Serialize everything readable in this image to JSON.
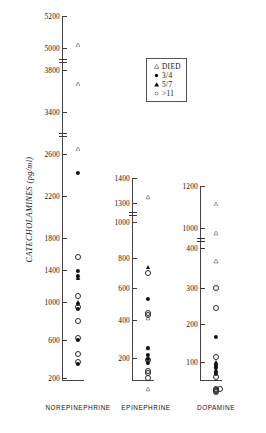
{
  "chart_data": {
    "type": "scatter",
    "title": "",
    "ylabel": "CATECHOLAMINES  (pg/ml)",
    "xlabel": "",
    "grid": false,
    "legend_position": "top-center",
    "note": "Three independent vertical dot-plot panels, each with its own broken y-axis scale. Marker shape/fill encodes outcome group.",
    "legend": [
      {
        "symbol": "open-triangle",
        "label": "DIED"
      },
      {
        "symbol": "filled-circle",
        "label": "3/4"
      },
      {
        "symbol": "filled-triangle",
        "label": "5/7"
      },
      {
        "symbol": "open-circle",
        "label": ">11"
      }
    ],
    "categories": [
      "NOREPINEPHRINE",
      "EPINEPHRINE",
      "DOPAMINE"
    ],
    "panels": [
      {
        "name": "NOREPINEPHRINE",
        "tick_labels": [
          "5200",
          "5000",
          "3800",
          "3400",
          "2600",
          "2200",
          "1800",
          "1400",
          "1000",
          "600",
          "200"
        ],
        "axis_breaks": [
          "between 5000 and 3800",
          "between 3400 and 2600"
        ],
        "points": [
          {
            "value": 5080,
            "symbol": "open-triangle"
          },
          {
            "value": 3760,
            "symbol": "open-triangle"
          },
          {
            "value": 2880,
            "symbol": "open-triangle"
          },
          {
            "value": 2420,
            "symbol": "filled-circle"
          },
          {
            "value": 1560,
            "symbol": "open-circle"
          },
          {
            "value": 1430,
            "symbol": "open-triangle"
          },
          {
            "value": 1390,
            "symbol": "filled-circle"
          },
          {
            "value": 1330,
            "symbol": "filled-circle"
          },
          {
            "value": 1300,
            "symbol": "filled-triangle"
          },
          {
            "value": 1080,
            "symbol": "open-circle"
          },
          {
            "value": 1000,
            "symbol": "filled-triangle"
          },
          {
            "value": 980,
            "symbol": "filled-circle"
          },
          {
            "value": 950,
            "symbol": "open-circle"
          },
          {
            "value": 930,
            "symbol": "filled-circle"
          },
          {
            "value": 800,
            "symbol": "open-circle"
          },
          {
            "value": 620,
            "symbol": "open-circle"
          },
          {
            "value": 600,
            "symbol": "filled-circle"
          },
          {
            "value": 450,
            "symbol": "open-circle"
          },
          {
            "value": 370,
            "symbol": "open-circle"
          },
          {
            "value": 345,
            "symbol": "filled-circle"
          }
        ]
      },
      {
        "name": "EPINEPHRINE",
        "tick_labels": [
          "1400",
          "1300",
          "1000",
          "800",
          "600",
          "400",
          "200"
        ],
        "axis_breaks": [
          "between 1300 and 1000"
        ],
        "points": [
          {
            "value": 1360,
            "symbol": "open-triangle"
          },
          {
            "value": 740,
            "symbol": "filled-triangle"
          },
          {
            "value": 700,
            "symbol": "open-circle"
          },
          {
            "value": 530,
            "symbol": "filled-circle"
          },
          {
            "value": 470,
            "symbol": "open-triangle"
          },
          {
            "value": 445,
            "symbol": "open-circle"
          },
          {
            "value": 430,
            "symbol": "open-circle"
          },
          {
            "value": 300,
            "symbol": "open-triangle"
          },
          {
            "value": 255,
            "symbol": "filled-circle"
          },
          {
            "value": 240,
            "symbol": "open-triangle"
          },
          {
            "value": 215,
            "symbol": "filled-circle"
          },
          {
            "value": 205,
            "symbol": "filled-triangle"
          },
          {
            "value": 195,
            "symbol": "filled-circle"
          },
          {
            "value": 190,
            "symbol": "open-circle"
          },
          {
            "value": 175,
            "symbol": "filled-circle"
          },
          {
            "value": 130,
            "symbol": "open-circle"
          },
          {
            "value": 120,
            "symbol": "open-circle"
          },
          {
            "value": 95,
            "symbol": "open-circle"
          },
          {
            "value": 85,
            "symbol": "open-triangle"
          }
        ]
      },
      {
        "name": "DOPAMINE",
        "tick_labels": [
          "1200",
          "1000",
          "400",
          "300",
          "200",
          "100"
        ],
        "axis_breaks": [
          "between 1000 and 400"
        ],
        "points": [
          {
            "value": 1160,
            "symbol": "open-triangle"
          },
          {
            "value": 1020,
            "symbol": "open-triangle"
          },
          {
            "value": 390,
            "symbol": "open-triangle"
          },
          {
            "value": 300,
            "symbol": "open-circle"
          },
          {
            "value": 245,
            "symbol": "open-circle"
          },
          {
            "value": 165,
            "symbol": "filled-circle"
          },
          {
            "value": 122,
            "symbol": "open-triangle"
          },
          {
            "value": 112,
            "symbol": "open-circle"
          },
          {
            "value": 100,
            "symbol": "filled-triangle"
          },
          {
            "value": 92,
            "symbol": "filled-circle"
          },
          {
            "value": 86,
            "symbol": "filled-circle"
          },
          {
            "value": 80,
            "symbol": "filled-triangle"
          },
          {
            "value": 74,
            "symbol": "filled-circle"
          },
          {
            "value": 68,
            "symbol": "filled-circle"
          },
          {
            "value": 60,
            "symbol": "open-circle"
          },
          {
            "value": 30,
            "symbol": "open-circle"
          },
          {
            "value": 28,
            "symbol": "open-circle"
          },
          {
            "value": 26,
            "symbol": "open-circle"
          },
          {
            "value": 24,
            "symbol": "open-circle"
          },
          {
            "value": 22,
            "symbol": "open-circle"
          }
        ]
      }
    ]
  }
}
